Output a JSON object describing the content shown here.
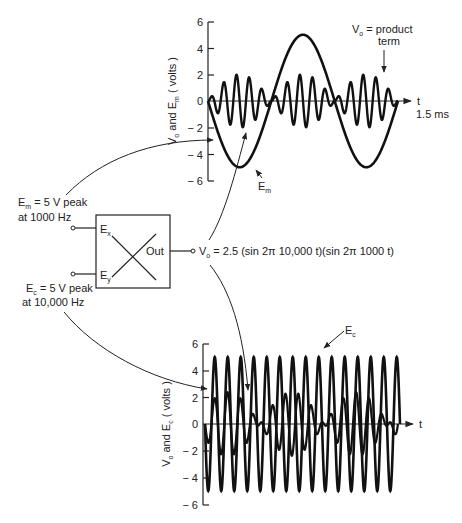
{
  "top_chart": {
    "ylabel_main": "V",
    "ylabel_sub1": "o",
    "ylabel_mid": " and E",
    "ylabel_sub2": "m",
    "ylabel_end": " ( volts )",
    "ticks": [
      "6",
      "4",
      "2",
      "0",
      "− 2",
      "− 4",
      "− 6"
    ],
    "xlabel": "t",
    "xlabel_end": "1.5 ms",
    "annotation_vo_main": "V",
    "annotation_vo_sub": "o",
    "annotation_vo_rest": " = product",
    "annotation_vo_line2": "term",
    "annotation_em_main": "E",
    "annotation_em_sub": "m"
  },
  "bottom_chart": {
    "ylabel_main": "V",
    "ylabel_sub1": "o",
    "ylabel_mid": " and E",
    "ylabel_sub2": "c",
    "ylabel_end": " ( volts )",
    "ticks": [
      "6",
      "4",
      "2",
      "0",
      "− 2",
      "− 4",
      "− 6"
    ],
    "xlabel": "t",
    "annotation_ec_main": "E",
    "annotation_ec_sub": "c"
  },
  "multiplier": {
    "input_x_main": "E",
    "input_x_sub": "x",
    "input_y_main": "E",
    "input_y_sub": "y",
    "output_label": "Out"
  },
  "inputs": {
    "em_main": "E",
    "em_sub": "m",
    "em_rest": " = 5 V peak",
    "em_line2": "at 1000 Hz",
    "ec_main": "E",
    "ec_sub": "c",
    "ec_rest": " = 5 V peak",
    "ec_line2": "at 10,000 Hz"
  },
  "output": {
    "vo_main": "V",
    "vo_sub": "o",
    "equation": " = 2.5 (sin 2π 10,000 t)(sin 2π 1000 t)"
  },
  "chart_data": [
    {
      "type": "line",
      "title": "Product term and modulating signal",
      "xlabel": "t (0 to 1.5 ms)",
      "ylabel": "Vo and Em (volts)",
      "ylim": [
        -6,
        6
      ],
      "xlim_ms": [
        0,
        1.5
      ],
      "yticks": [
        6,
        4,
        2,
        0,
        -2,
        -4,
        -6
      ],
      "grid": false,
      "series": [
        {
          "name": "Em",
          "formula": "-5 sin(2π·1000 t)",
          "amplitude": 5,
          "frequency_hz": 1000,
          "t_ms": [
            0,
            0.25,
            0.5,
            0.75,
            1.0,
            1.25,
            1.5
          ],
          "values": [
            0,
            -5,
            0,
            5,
            0,
            -5,
            0
          ]
        },
        {
          "name": "Vo = product term",
          "formula": "2.5 sin(2π·10000 t) sin(2π·1000 t)",
          "peak": 2.5,
          "cycles": 15
        }
      ]
    },
    {
      "type": "line",
      "title": "Product term and carrier",
      "xlabel": "t",
      "ylabel": "Vo and Ec (volts)",
      "ylim": [
        -6,
        6
      ],
      "yticks": [
        6,
        4,
        2,
        0,
        -2,
        -4,
        -6
      ],
      "grid": false,
      "series": [
        {
          "name": "Ec",
          "formula": "-5 sin(2π·10000 t)",
          "amplitude": 5,
          "frequency_hz": 10000,
          "cycles": 15
        },
        {
          "name": "Vo",
          "formula": "2.5 sin(2π·10000 t) sin(2π·1000 t)",
          "peak": 2.5
        }
      ]
    }
  ]
}
